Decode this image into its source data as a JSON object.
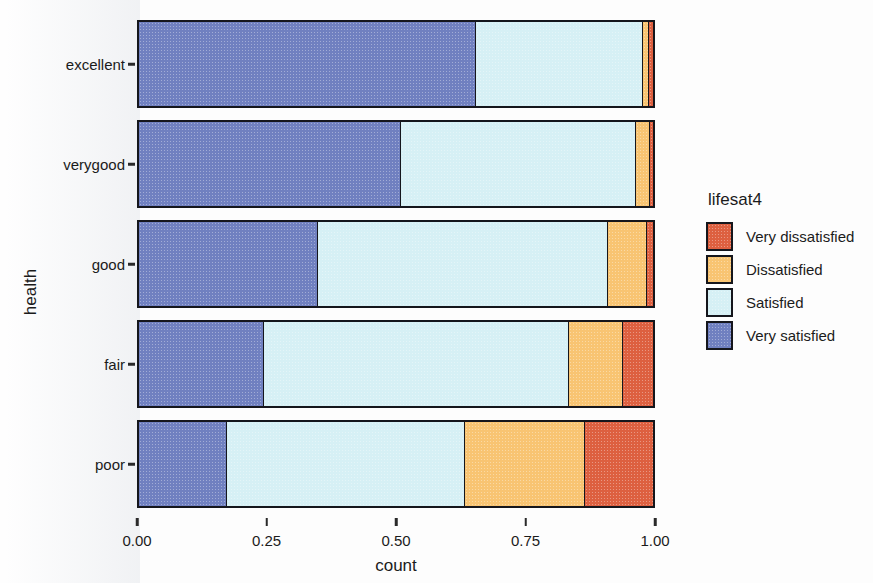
{
  "chart_data": {
    "type": "bar",
    "orientation": "horizontal",
    "stacked": true,
    "stack_mode": "fill",
    "title": "",
    "xlabel": "count",
    "ylabel": "health",
    "xlim": [
      0.0,
      1.0
    ],
    "xticks": [
      "0.00",
      "0.25",
      "0.50",
      "0.75",
      "1.00"
    ],
    "xtick_values": [
      0.0,
      0.25,
      0.5,
      0.75,
      1.0
    ],
    "grid": false,
    "legend_position": "right",
    "legend_title": "lifesat4",
    "categories": [
      "excellent",
      "verygood",
      "good",
      "fair",
      "poor"
    ],
    "series": [
      {
        "name": "Very dissatisfied",
        "color": "#dd6040",
        "values": [
          0.007,
          0.005,
          0.012,
          0.059,
          0.133
        ]
      },
      {
        "name": "Dissatisfied",
        "color": "#f8c472",
        "values": [
          0.013,
          0.028,
          0.075,
          0.105,
          0.232
        ]
      },
      {
        "name": "Satisfied",
        "color": "#d6f0f5",
        "values": [
          0.325,
          0.457,
          0.565,
          0.592,
          0.463
        ]
      },
      {
        "name": "Very satisfied",
        "color": "#7080c0",
        "values": [
          0.655,
          0.51,
          0.348,
          0.244,
          0.172
        ]
      }
    ],
    "stack_order": [
      "Very satisfied",
      "Satisfied",
      "Dissatisfied",
      "Very dissatisfied"
    ]
  },
  "axes": {
    "x_title": "count",
    "y_title": "health",
    "x_tick_labels": [
      "0.00",
      "0.25",
      "0.50",
      "0.75",
      "1.00"
    ],
    "y_tick_labels": [
      "excellent",
      "verygood",
      "good",
      "fair",
      "poor"
    ]
  },
  "legend": {
    "title": "lifesat4",
    "items": [
      {
        "label": "Very dissatisfied",
        "color": "#dd6040"
      },
      {
        "label": "Dissatisfied",
        "color": "#f8c472"
      },
      {
        "label": "Satisfied",
        "color": "#d6f0f5"
      },
      {
        "label": "Very satisfied",
        "color": "#7080c0"
      }
    ]
  },
  "style": {
    "bar_stroke": "#15161c",
    "text_color": "#1b1b1b",
    "background": "#ffffff"
  }
}
